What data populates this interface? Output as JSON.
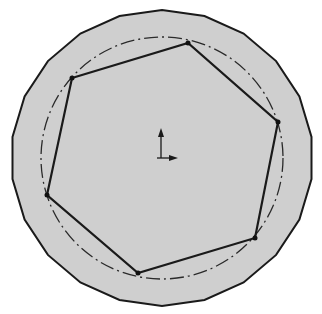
{
  "diagram": {
    "type": "cad-sketch",
    "colors": {
      "background": "#ffffff",
      "disc_fill": "#cfcfcf",
      "stroke": "#1a1a1a",
      "construction": "#2a2a2a"
    },
    "outer_polygon": {
      "center": [
        162,
        158
      ],
      "radius_x": 151,
      "radius_y": 148,
      "sides": 22
    },
    "construction_circle": {
      "center": [
        162,
        158
      ],
      "radius": 121,
      "style": "dash-dot"
    },
    "hexagon_vertices": [
      [
        72,
        78
      ],
      [
        188,
        43
      ],
      [
        278,
        122
      ],
      [
        255,
        238
      ],
      [
        138,
        273
      ],
      [
        47,
        195
      ]
    ],
    "origin_marker": {
      "position": [
        161,
        158
      ],
      "icon": "coordinate-axes-icon"
    }
  }
}
